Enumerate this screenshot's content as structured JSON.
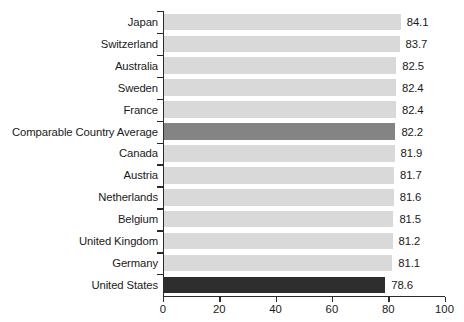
{
  "chart_data": {
    "type": "bar",
    "orientation": "horizontal",
    "title": "",
    "subtitle": "",
    "xlabel": "",
    "ylabel": "",
    "xlim": [
      0,
      100
    ],
    "xticks": [
      0,
      20,
      40,
      60,
      80,
      100
    ],
    "xtick_labels": [
      "0",
      "20",
      "40",
      "60",
      "80",
      "100"
    ],
    "grid": false,
    "legend": null,
    "categories": [
      "Japan",
      "Switzerland",
      "Australia",
      "Sweden",
      "France",
      "Comparable Country Average",
      "Canada",
      "Austria",
      "Netherlands",
      "Belgium",
      "United Kingdom",
      "Germany",
      "United States"
    ],
    "values": [
      84.1,
      83.7,
      82.5,
      82.4,
      82.4,
      82.2,
      81.9,
      81.7,
      81.6,
      81.5,
      81.2,
      81.1,
      78.6
    ],
    "value_labels": [
      "84.1",
      "83.7",
      "82.5",
      "82.4",
      "82.4",
      "82.2",
      "81.9",
      "81.7",
      "81.6",
      "81.5",
      "81.2",
      "81.1",
      "78.6"
    ],
    "bar_styles": [
      "default",
      "default",
      "default",
      "default",
      "default",
      "accent",
      "default",
      "default",
      "default",
      "default",
      "default",
      "default",
      "highlight"
    ],
    "colors": {
      "bar_default": "#d9d9d9",
      "bar_accent": "#848484",
      "bar_highlight": "#2e2e2e",
      "axis": "#2b2b2b",
      "text": "#1a1a1a",
      "background": "#ffffff"
    }
  }
}
